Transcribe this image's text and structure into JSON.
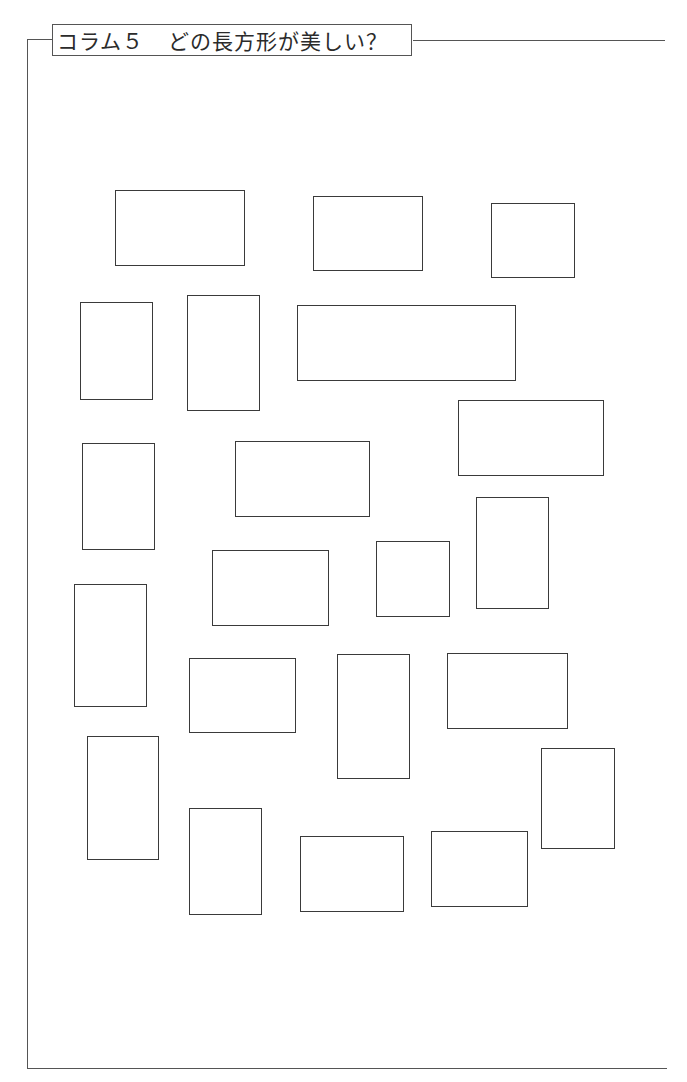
{
  "column": {
    "label": "コラム５",
    "title": "どの長方形が美しい？"
  },
  "figure": {
    "stroke_color": "#3a3a3a",
    "rectangles": [
      {
        "x": 115,
        "y": 190,
        "w": 130,
        "h": 76
      },
      {
        "x": 313,
        "y": 196,
        "w": 110,
        "h": 75
      },
      {
        "x": 491,
        "y": 203,
        "w": 84,
        "h": 75
      },
      {
        "x": 80,
        "y": 302,
        "w": 73,
        "h": 98
      },
      {
        "x": 187,
        "y": 295,
        "w": 73,
        "h": 116
      },
      {
        "x": 297,
        "y": 305,
        "w": 219,
        "h": 76
      },
      {
        "x": 458,
        "y": 400,
        "w": 146,
        "h": 76
      },
      {
        "x": 82,
        "y": 443,
        "w": 73,
        "h": 107
      },
      {
        "x": 235,
        "y": 441,
        "w": 135,
        "h": 76
      },
      {
        "x": 212,
        "y": 550,
        "w": 117,
        "h": 76
      },
      {
        "x": 376,
        "y": 541,
        "w": 74,
        "h": 76
      },
      {
        "x": 476,
        "y": 497,
        "w": 73,
        "h": 112
      },
      {
        "x": 74,
        "y": 584,
        "w": 73,
        "h": 123
      },
      {
        "x": 189,
        "y": 658,
        "w": 107,
        "h": 75
      },
      {
        "x": 337,
        "y": 654,
        "w": 73,
        "h": 125
      },
      {
        "x": 447,
        "y": 653,
        "w": 121,
        "h": 76
      },
      {
        "x": 87,
        "y": 736,
        "w": 72,
        "h": 124
      },
      {
        "x": 189,
        "y": 808,
        "w": 73,
        "h": 107
      },
      {
        "x": 300,
        "y": 836,
        "w": 104,
        "h": 76
      },
      {
        "x": 431,
        "y": 831,
        "w": 97,
        "h": 76
      },
      {
        "x": 541,
        "y": 748,
        "w": 74,
        "h": 101
      }
    ]
  }
}
